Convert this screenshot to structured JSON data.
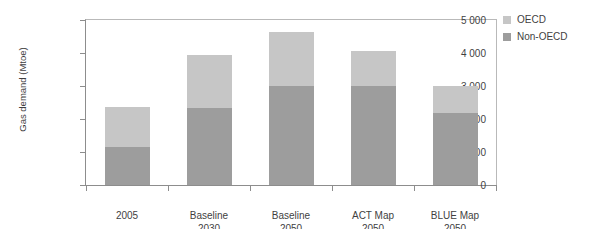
{
  "figure": {
    "title_partial": "",
    "y_axis_title": "Gas demand (Mtoe)"
  },
  "legend": {
    "position": "right",
    "items": [
      {
        "label": "OECD",
        "color": "#c6c6c6",
        "swatch_name": "legend-swatch-oecd"
      },
      {
        "label": "Non-OECD",
        "color": "#9d9d9d",
        "swatch_name": "legend-swatch-non-oecd"
      }
    ]
  },
  "chart_data": {
    "type": "bar",
    "stacked": true,
    "title": "",
    "xlabel": "",
    "ylabel": "Gas demand (Mtoe)",
    "ylim": [
      0,
      5000
    ],
    "ytick_values": [
      0,
      1000,
      2000,
      3000,
      4000,
      5000
    ],
    "ytick_labels": [
      "0",
      "1 000",
      "2 000",
      "3 000",
      "4 000",
      "5 000"
    ],
    "grid": false,
    "legend_position": "right",
    "categories": [
      "2005",
      "Baseline 2030",
      "Baseline 2050",
      "ACT Map 2050",
      "BLUE Map 2050"
    ],
    "category_lines": [
      [
        "2005"
      ],
      [
        "Baseline",
        "2030"
      ],
      [
        "Baseline",
        "2050"
      ],
      [
        "ACT Map",
        "2050"
      ],
      [
        "BLUE Map",
        "2050"
      ]
    ],
    "series": [
      {
        "name": "Non-OECD",
        "color": "#9d9d9d",
        "values": [
          1150,
          2320,
          3000,
          3000,
          2170
        ]
      },
      {
        "name": "OECD",
        "color": "#c6c6c6",
        "values": [
          1200,
          1630,
          1650,
          1050,
          830
        ]
      }
    ],
    "totals": [
      2350,
      3950,
      4650,
      4050,
      3000
    ]
  }
}
